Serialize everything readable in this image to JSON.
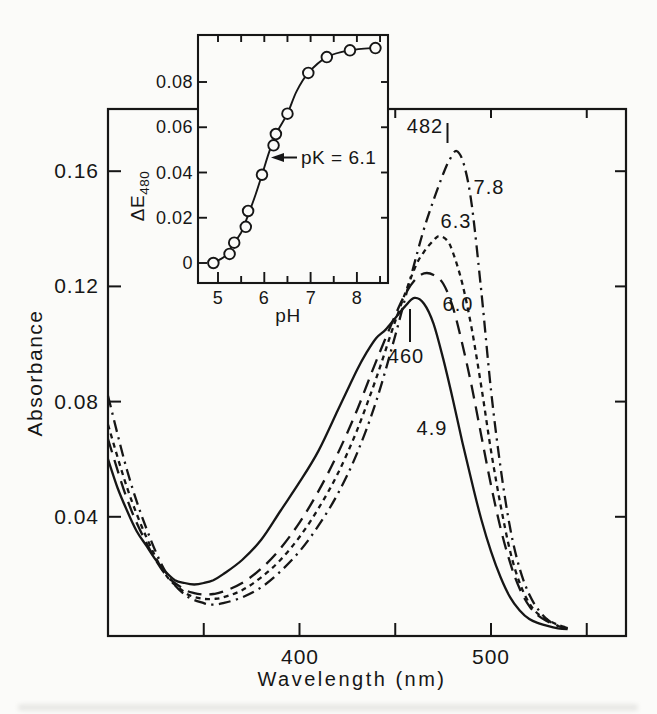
{
  "figure": {
    "background": "#fbfbf9",
    "ink": "#161616"
  },
  "chart_data": [
    {
      "id": "main-spectra",
      "type": "line",
      "title": "",
      "xlabel": "Wavelength (nm)",
      "ylabel": "Absorbance",
      "xlim": [
        300,
        570
      ],
      "ylim": [
        0,
        0.182
      ],
      "grid": false,
      "frame": "box",
      "x_ticks": [
        350,
        400,
        450,
        500,
        550
      ],
      "x_tick_labels": [
        "400",
        "500"
      ],
      "x_labeled_tick_values": [
        400,
        500
      ],
      "y_ticks": [
        0.04,
        0.08,
        0.12,
        0.16
      ],
      "y_tick_labels": [
        "0.16",
        "0.12",
        "0.08",
        "0.04"
      ],
      "series": [
        {
          "name": "pH 4.9",
          "label": "4.9",
          "style": "solid",
          "peak_label": "460",
          "peak_wavelength_nm": 460,
          "peak_absorbance": 0.116,
          "x": [
            300,
            305,
            310,
            315,
            320,
            325,
            330,
            335,
            340,
            345,
            350,
            355,
            360,
            370,
            380,
            390,
            400,
            410,
            420,
            425,
            430,
            435,
            440,
            445,
            450,
            455,
            460,
            465,
            470,
            475,
            480,
            485,
            490,
            495,
            500,
            505,
            510,
            515,
            520,
            525,
            530,
            535,
            540
          ],
          "y": [
            0.06,
            0.05,
            0.042,
            0.035,
            0.03,
            0.025,
            0.021,
            0.018,
            0.017,
            0.0165,
            0.017,
            0.018,
            0.02,
            0.025,
            0.032,
            0.042,
            0.052,
            0.063,
            0.077,
            0.084,
            0.091,
            0.097,
            0.102,
            0.105,
            0.109,
            0.113,
            0.116,
            0.114,
            0.107,
            0.095,
            0.081,
            0.066,
            0.052,
            0.039,
            0.028,
            0.019,
            0.012,
            0.0075,
            0.0045,
            0.003,
            0.002,
            0.0013,
            0.001
          ]
        },
        {
          "name": "pH 6.0",
          "label": "6.0",
          "style": "long-dash",
          "x": [
            300,
            310,
            320,
            330,
            340,
            345,
            350,
            355,
            360,
            370,
            380,
            390,
            400,
            410,
            420,
            430,
            440,
            450,
            455,
            460,
            465,
            470,
            475,
            480,
            485,
            490,
            495,
            500,
            505,
            510,
            515,
            520,
            525,
            530,
            535,
            540
          ],
          "y": [
            0.067,
            0.046,
            0.031,
            0.02,
            0.0148,
            0.0135,
            0.013,
            0.0132,
            0.014,
            0.017,
            0.022,
            0.029,
            0.038,
            0.049,
            0.062,
            0.077,
            0.094,
            0.11,
            0.117,
            0.122,
            0.1245,
            0.124,
            0.121,
            0.113,
            0.1,
            0.085,
            0.068,
            0.051,
            0.036,
            0.024,
            0.015,
            0.009,
            0.0055,
            0.0035,
            0.002,
            0.0013
          ]
        },
        {
          "name": "pH 6.3",
          "label": "6.3",
          "style": "short-dash",
          "x": [
            300,
            310,
            320,
            330,
            340,
            345,
            350,
            355,
            360,
            370,
            380,
            390,
            400,
            410,
            420,
            430,
            440,
            450,
            460,
            465,
            470,
            473,
            477,
            480,
            485,
            490,
            495,
            500,
            505,
            510,
            515,
            520,
            525,
            530,
            535,
            540
          ],
          "y": [
            0.072,
            0.05,
            0.033,
            0.02,
            0.0138,
            0.0122,
            0.0115,
            0.0115,
            0.012,
            0.0145,
            0.019,
            0.025,
            0.033,
            0.043,
            0.055,
            0.07,
            0.088,
            0.108,
            0.126,
            0.132,
            0.136,
            0.1375,
            0.136,
            0.132,
            0.121,
            0.105,
            0.085,
            0.063,
            0.044,
            0.028,
            0.017,
            0.01,
            0.006,
            0.004,
            0.0025,
            0.0015
          ]
        },
        {
          "name": "pH 7.8",
          "label": "7.8",
          "style": "dash-dot",
          "peak_label": "482",
          "peak_wavelength_nm": 482,
          "peak_absorbance": 0.167,
          "x": [
            300,
            310,
            320,
            330,
            340,
            350,
            355,
            360,
            370,
            380,
            390,
            400,
            410,
            420,
            430,
            440,
            450,
            460,
            465,
            470,
            475,
            478,
            482,
            486,
            490,
            495,
            500,
            505,
            510,
            515,
            520,
            525,
            530,
            535,
            540
          ],
          "y": [
            0.082,
            0.056,
            0.036,
            0.021,
            0.013,
            0.01,
            0.0095,
            0.01,
            0.012,
            0.0155,
            0.021,
            0.028,
            0.037,
            0.048,
            0.062,
            0.08,
            0.103,
            0.128,
            0.14,
            0.15,
            0.159,
            0.1635,
            0.167,
            0.162,
            0.148,
            0.118,
            0.084,
            0.057,
            0.036,
            0.022,
            0.013,
            0.0075,
            0.004,
            0.0022,
            0.0014
          ]
        }
      ]
    },
    {
      "id": "inset-titration",
      "type": "scatter",
      "xlabel": "pH",
      "ylabel": "ΔE480",
      "ylabel_base": "ΔE",
      "ylabel_sub": "480",
      "xlim": [
        4.55,
        8.65
      ],
      "ylim": [
        -0.004,
        0.101
      ],
      "grid": false,
      "frame": "box",
      "x_ticks": [
        5,
        6,
        7,
        8
      ],
      "x_minor_ticks": [
        5.5,
        6.5,
        7.5,
        8.5
      ],
      "x_tick_labels": [
        "5",
        "6",
        "7",
        "8"
      ],
      "y_ticks": [
        0,
        0.02,
        0.04,
        0.06,
        0.08
      ],
      "y_tick_labels": [
        "0.08",
        "0.06",
        "0.04",
        "0.02",
        "0"
      ],
      "annotation": "pK = 6.1",
      "pK": 6.1,
      "points": {
        "x": [
          4.9,
          5.25,
          5.35,
          5.6,
          5.65,
          5.95,
          6.2,
          6.25,
          6.5,
          6.95,
          7.35,
          7.85,
          8.4
        ],
        "y": [
          0.0,
          0.004,
          0.009,
          0.016,
          0.023,
          0.039,
          0.052,
          0.057,
          0.066,
          0.084,
          0.091,
          0.094,
          0.095
        ]
      },
      "trend": {
        "x": [
          4.88,
          5.15,
          5.32,
          5.5,
          5.62,
          5.8,
          5.95,
          6.12,
          6.28,
          6.5,
          6.7,
          6.95,
          7.35,
          7.85,
          8.45
        ],
        "y": [
          0.0,
          0.003,
          0.008,
          0.0135,
          0.0195,
          0.0295,
          0.039,
          0.05,
          0.058,
          0.066,
          0.076,
          0.084,
          0.091,
          0.094,
          0.0952
        ]
      }
    }
  ]
}
